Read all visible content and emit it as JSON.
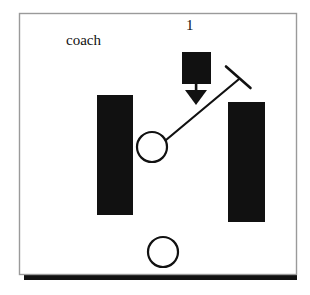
{
  "figure": {
    "kind": "technical-line-drawing",
    "background_color": "#ffffff",
    "ink_color": "#111111",
    "frame": {
      "thin_border_color": "#9a9a9a",
      "shadow_color": "#111111",
      "x": 19,
      "y": 13,
      "width": 278,
      "height": 262,
      "shadow_offset": 5
    },
    "labels": {
      "coach": "coach",
      "reference_numeral": "1"
    },
    "elements": [
      {
        "name": "pivot-circle",
        "shape": "circle",
        "cx": 152,
        "cy": 147,
        "r": 15,
        "fill": "none",
        "stroke": "#111111",
        "stroke_width": 2
      },
      {
        "name": "lower-circle",
        "shape": "circle",
        "cx": 163,
        "cy": 252,
        "r": 15,
        "fill": "none",
        "stroke": "#111111",
        "stroke_width": 2
      },
      {
        "name": "diagonal-arm",
        "shape": "line",
        "x1": 166,
        "y1": 140,
        "x2": 238,
        "y2": 80,
        "stroke": "#111111",
        "stroke_width": 2
      },
      {
        "name": "t-crossbar",
        "shape": "line",
        "x1": 226,
        "y1": 67,
        "x2": 250,
        "y2": 88,
        "stroke": "#111111",
        "stroke_width": 2
      },
      {
        "name": "load-block",
        "shape": "rect",
        "x": 182,
        "y": 52,
        "width": 29,
        "height": 32,
        "fill": "#111111"
      },
      {
        "name": "force-arrow",
        "shape": "arrow",
        "direction": "down",
        "shaft_x": 196,
        "shaft_y1": 84,
        "shaft_y2": 91,
        "head_half_width": 11,
        "head_y_top": 90,
        "head_y_tip": 105,
        "fill": "#111111"
      },
      {
        "name": "left-bar",
        "shape": "rect",
        "x": 97,
        "y": 95,
        "width": 36,
        "height": 120,
        "fill": "#111111"
      },
      {
        "name": "right-bar",
        "shape": "rect",
        "x": 228,
        "y": 102,
        "width": 37,
        "height": 120,
        "fill": "#111111"
      }
    ]
  }
}
